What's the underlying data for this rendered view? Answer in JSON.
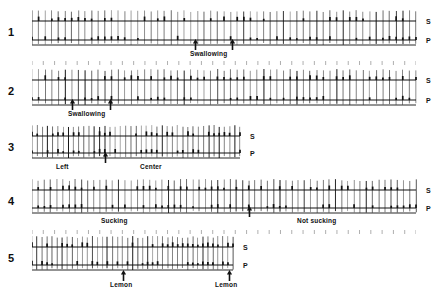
{
  "figure": {
    "title": "",
    "background_color": "#ffffff",
    "ink_color": "#111111",
    "channel_labels": {
      "s": "S",
      "p": "P"
    },
    "traces": [
      {
        "number": "1",
        "x_start": 32,
        "x_end": 416,
        "y_top_baseline": 21,
        "y_bottom_baseline": 40,
        "s_label": "S",
        "p_label": "P",
        "tick_count": 58,
        "has_timing_row": true,
        "timing_row_y": 60,
        "events": [
          {
            "label": "Swallowing",
            "label_x": 190,
            "label_y": 51,
            "arrows": [
              195,
              232
            ]
          }
        ]
      },
      {
        "number": "2",
        "x_start": 32,
        "x_end": 416,
        "y_top_baseline": 80,
        "y_bottom_baseline": 100,
        "s_label": "S",
        "p_label": "P",
        "tick_count": 58,
        "has_timing_row": false,
        "timing_row_y": 0,
        "events": [
          {
            "label": "Swallowing",
            "label_x": 68,
            "label_y": 111,
            "arrows": [
              72,
              110
            ]
          }
        ]
      },
      {
        "number": "3",
        "x_start": 32,
        "x_end": 240,
        "y_top_baseline": 136,
        "y_bottom_baseline": 153,
        "s_label": "S",
        "p_label": "P",
        "tick_count": 40,
        "has_timing_row": false,
        "timing_row_y": 0,
        "events": [
          {
            "label": "Left",
            "label_x": 56,
            "label_y": 164,
            "arrows": []
          },
          {
            "label": "Center",
            "label_x": 140,
            "label_y": 164,
            "arrows": [
              105
            ]
          }
        ]
      },
      {
        "number": "4",
        "x_start": 32,
        "x_end": 416,
        "y_top_baseline": 190,
        "y_bottom_baseline": 208,
        "s_label": "S",
        "p_label": "P",
        "tick_count": 62,
        "has_timing_row": true,
        "timing_row_y": 229,
        "events": [
          {
            "label": "Sucking",
            "label_x": 101,
            "label_y": 218,
            "arrows": []
          },
          {
            "label": "Not sucking",
            "label_x": 297,
            "label_y": 218,
            "arrows": [
              249
            ]
          }
        ]
      },
      {
        "number": "5",
        "x_start": 32,
        "x_end": 233,
        "y_top_baseline": 247,
        "y_bottom_baseline": 265,
        "s_label": "S",
        "p_label": "P",
        "tick_count": 40,
        "has_timing_row": false,
        "timing_row_y": 0,
        "events": [
          {
            "label": "Lemon",
            "label_x": 110,
            "label_y": 282,
            "arrows": [
              123
            ]
          },
          {
            "label": "Lemon",
            "label_x": 215,
            "label_y": 282,
            "arrows": [
              229
            ]
          }
        ]
      }
    ]
  }
}
